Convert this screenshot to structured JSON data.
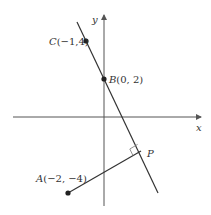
{
  "diagram": {
    "axes": {
      "x_label": "x",
      "y_label": "y"
    },
    "points": {
      "A": {
        "name": "A",
        "coords": "(−2, −4)",
        "x": -2,
        "y": -4
      },
      "B": {
        "name": "B",
        "coords": "(0, 2)",
        "x": 0,
        "y": 2
      },
      "C": {
        "name": "C",
        "coords": "(−1,4)",
        "x": -1,
        "y": 4
      },
      "P": {
        "name": "P"
      }
    },
    "annotations": {
      "right_angle_at": "P"
    },
    "colors": {
      "line": "#333333",
      "axis": "#555555"
    }
  }
}
